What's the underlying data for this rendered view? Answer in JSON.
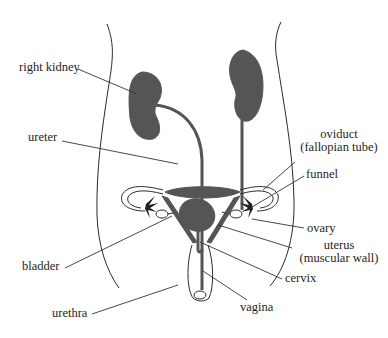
{
  "diagram": {
    "colors": {
      "organ_fill": "#555555",
      "outline": "#2a2a2a",
      "leader_line": "#333333",
      "text": "#1e1e1e",
      "background": "#ffffff"
    },
    "labels": {
      "right_kidney": "right kidney",
      "ureter": "ureter",
      "oviduct_line1": "oviduct",
      "oviduct_line2": "(fallopian tube)",
      "funnel": "funnel",
      "ovary": "ovary",
      "uterus_line1": "uterus",
      "uterus_line2": "(muscular wall)",
      "bladder": "bladder",
      "cervix": "cervix",
      "urethra": "urethra",
      "vagina": "vagina"
    }
  }
}
